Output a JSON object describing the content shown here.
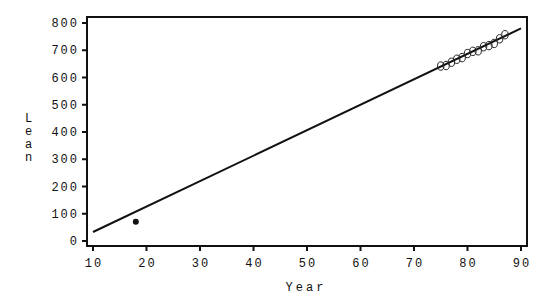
{
  "chart_data": {
    "type": "scatter",
    "title": "",
    "xlabel": "Year",
    "ylabel": "Lean",
    "xlim": [
      10,
      90
    ],
    "ylim": [
      0,
      800
    ],
    "xticks": [
      10,
      20,
      30,
      40,
      50,
      60,
      70,
      80,
      90
    ],
    "yticks": [
      0,
      100,
      200,
      300,
      400,
      500,
      600,
      700,
      800
    ],
    "grid": false,
    "legend": null,
    "series": [
      {
        "name": "observed",
        "marker": "open-circle",
        "x": [
          75,
          76,
          77,
          78,
          79,
          80,
          81,
          82,
          83,
          84,
          85,
          86,
          87
        ],
        "y": [
          642,
          644,
          656,
          667,
          673,
          688,
          696,
          698,
          713,
          717,
          725,
          742,
          757
        ]
      },
      {
        "name": "predicted",
        "marker": "filled-circle",
        "x": [
          18
        ],
        "y": [
          71
        ]
      },
      {
        "name": "fitted-line",
        "type": "line",
        "x": [
          10,
          90
        ],
        "y": [
          33,
          780
        ]
      }
    ]
  }
}
